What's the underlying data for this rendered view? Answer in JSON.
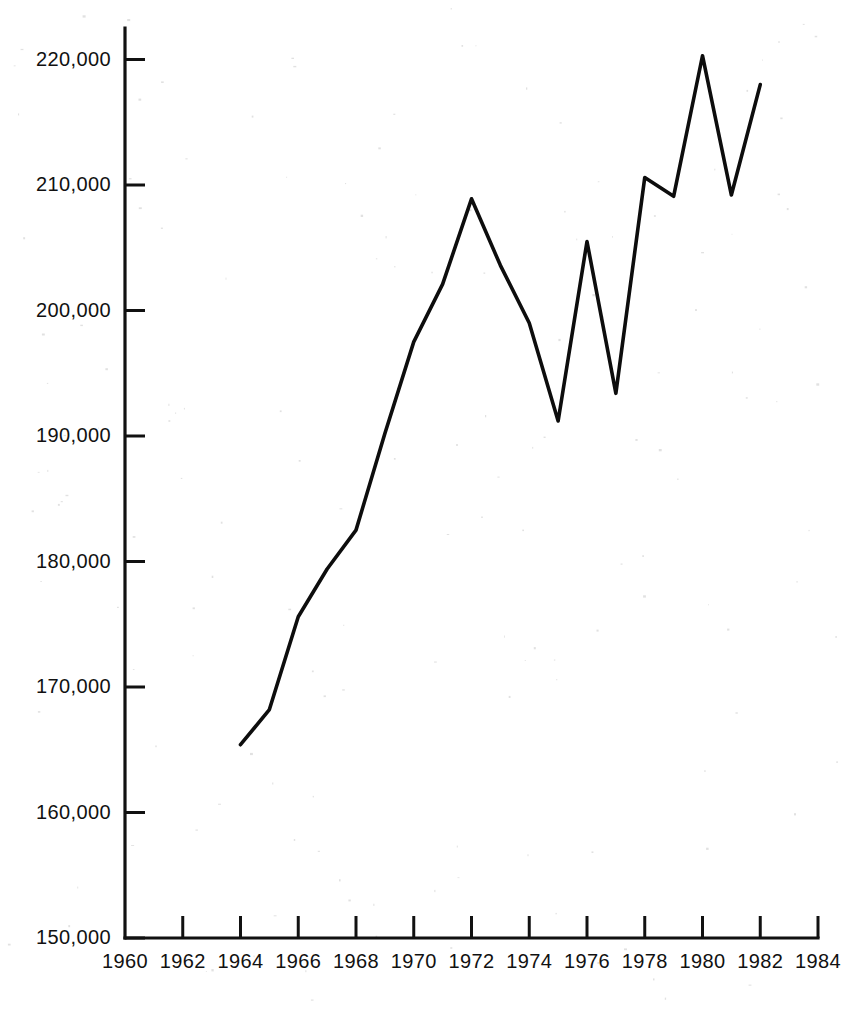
{
  "chart_data": {
    "type": "line",
    "title": "",
    "subtitle": "",
    "xlabel": "",
    "ylabel": "",
    "xlim": [
      1960,
      1984
    ],
    "ylim": [
      150000,
      222000
    ],
    "grid": false,
    "legend": false,
    "legend_position": "none",
    "x_tick_labels": [
      "1960",
      "1962",
      "1964",
      "1966",
      "1968",
      "1970",
      "1972",
      "1974",
      "1976",
      "1978",
      "1980",
      "1982",
      "1984"
    ],
    "x_tick_values": [
      1960,
      1962,
      1964,
      1966,
      1968,
      1970,
      1972,
      1974,
      1976,
      1978,
      1980,
      1982,
      1984
    ],
    "y_tick_labels": [
      "150,000",
      "160,000",
      "170,000",
      "180,000",
      "190,000",
      "200,000",
      "210,000",
      "220,000"
    ],
    "y_tick_values": [
      150000,
      160000,
      170000,
      180000,
      190000,
      200000,
      210000,
      220000
    ],
    "x": [
      1964,
      1965,
      1966,
      1967,
      1968,
      1969,
      1970,
      1971,
      1972,
      1973,
      1974,
      1975,
      1976,
      1977,
      1978,
      1979,
      1980,
      1981,
      1982
    ],
    "values": [
      165400,
      168200,
      175600,
      179400,
      182500,
      190200,
      197500,
      202100,
      208900,
      203600,
      199000,
      191200,
      205500,
      193400,
      210600,
      209100,
      220300,
      209200,
      218000
    ],
    "series": [
      {
        "name": "series-1",
        "color": "#0d0d0d",
        "values": [
          165400,
          168200,
          175600,
          179400,
          182500,
          190200,
          197500,
          202100,
          208900,
          203600,
          199000,
          191200,
          205500,
          193400,
          210600,
          209100,
          220300,
          209200,
          218000
        ]
      }
    ],
    "annotations": []
  },
  "figure": {
    "axis_color": "#111111",
    "background_color": "#ffffff",
    "line_color": "#0d0d0d"
  }
}
